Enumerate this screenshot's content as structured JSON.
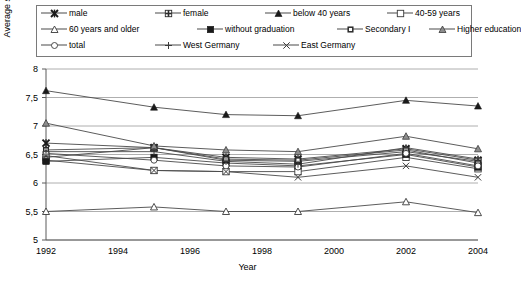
{
  "chart_data": {
    "type": "line",
    "title": "",
    "xlabel": "Year",
    "ylabel": "Average satisfaction",
    "x": [
      1992,
      1995,
      1997,
      1999,
      2002,
      2004
    ],
    "xlim": [
      1992,
      2004
    ],
    "ylim": [
      5,
      8
    ],
    "ytick_labels": [
      "5",
      "5,5",
      "6",
      "6,5",
      "7",
      "7,5",
      "8"
    ],
    "ytick_values": [
      5,
      5.5,
      6,
      6.5,
      7,
      7.5,
      8
    ],
    "xtick_labels": [
      "1992",
      "1994",
      "1996",
      "1998",
      "2000",
      "2002",
      "2004"
    ],
    "xtick_values": [
      1992,
      1994,
      1996,
      1998,
      2000,
      2002,
      2004
    ],
    "grid": true,
    "legend_position": "top",
    "series": [
      {
        "name": "male",
        "marker": "x-bold",
        "values": [
          6.7,
          6.62,
          6.45,
          6.42,
          6.6,
          6.4
        ]
      },
      {
        "name": "female",
        "marker": "square-grid",
        "values": [
          6.45,
          6.62,
          6.4,
          6.38,
          6.55,
          6.38
        ]
      },
      {
        "name": "below 40 years",
        "marker": "triangle-solid",
        "values": [
          7.62,
          7.33,
          7.2,
          7.18,
          7.45,
          7.35
        ]
      },
      {
        "name": "40-59 years",
        "marker": "square-open",
        "values": [
          6.4,
          6.22,
          6.2,
          6.2,
          6.45,
          6.25
        ]
      },
      {
        "name": "60 years and older",
        "marker": "triangle-open",
        "values": [
          5.5,
          5.58,
          5.5,
          5.5,
          5.67,
          5.48
        ]
      },
      {
        "name": "without graduation",
        "marker": "square-solid",
        "values": [
          6.38,
          6.45,
          6.35,
          6.3,
          6.5,
          6.28
        ]
      },
      {
        "name": "Secondary I",
        "marker": "square-small",
        "values": [
          6.58,
          6.62,
          6.42,
          6.4,
          6.58,
          6.35
        ]
      },
      {
        "name": "Higher education",
        "marker": "triangle-grey",
        "values": [
          7.05,
          6.65,
          6.58,
          6.55,
          6.82,
          6.6
        ]
      },
      {
        "name": "total",
        "marker": "circle-open",
        "values": [
          6.52,
          6.4,
          6.3,
          6.28,
          6.52,
          6.3
        ]
      },
      {
        "name": "West Germany",
        "marker": "plus",
        "values": [
          6.55,
          6.55,
          6.38,
          6.33,
          6.62,
          6.42
        ]
      },
      {
        "name": "East Germany",
        "marker": "x-thin",
        "values": [
          6.48,
          6.22,
          6.2,
          6.1,
          6.3,
          6.1
        ]
      }
    ]
  },
  "legend": {
    "rows": [
      [
        "male",
        "female",
        "below 40 years",
        "40-59 years"
      ],
      [
        "60 years and older",
        "without graduation",
        "Secondary I",
        "Higher education"
      ],
      [
        "total",
        "West Germany",
        "East Germany"
      ]
    ]
  },
  "colors": {
    "axis": "#5a5a5a",
    "grid": "#9a9a9a",
    "line": "#4a4a4a",
    "text": "#000000",
    "marker_solid": "#1a1a1a",
    "marker_open": "#ffffff"
  }
}
